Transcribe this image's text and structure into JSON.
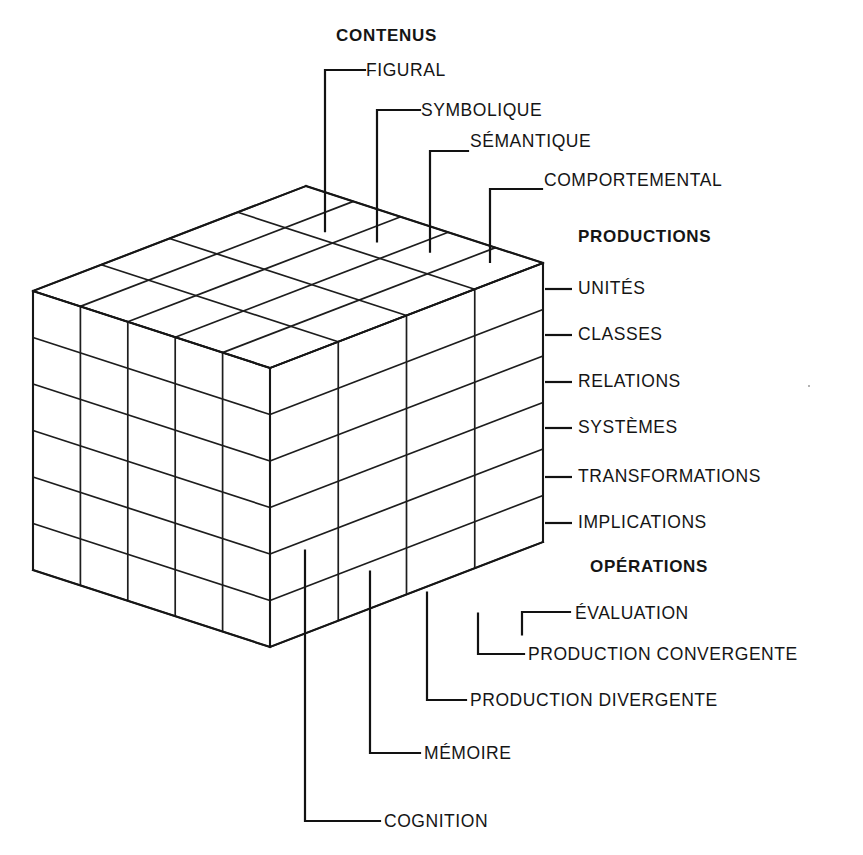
{
  "diagram": {
    "model": "cube 4 x 6 x 5",
    "axes": {
      "contents": {
        "header": "CONTENUS",
        "items": [
          {
            "label": "FIGURAL"
          },
          {
            "label": "SYMBOLIQUE"
          },
          {
            "label": "SÉMANTIQUE"
          },
          {
            "label": "COMPORTEMENTAL"
          }
        ]
      },
      "productions": {
        "header": "PRODUCTIONS",
        "items": [
          {
            "label": "UNITÉS"
          },
          {
            "label": "CLASSES"
          },
          {
            "label": "RELATIONS"
          },
          {
            "label": "SYSTÈMES"
          },
          {
            "label": "TRANSFORMATIONS"
          },
          {
            "label": "IMPLICATIONS"
          }
        ]
      },
      "operations": {
        "header": "OPÉRATIONS",
        "items": [
          {
            "label": "ÉVALUATION"
          },
          {
            "label": "PRODUCTION CONVERGENTE"
          },
          {
            "label": "PRODUCTION DIVERGENTE"
          },
          {
            "label": "MÉMOIRE"
          },
          {
            "label": "COGNITION"
          }
        ]
      }
    },
    "colors": {
      "ink": "#151515",
      "background": "#ffffff"
    }
  },
  "chart_data": {
    "type": "diagram",
    "dimensions": [
      {
        "name": "CONTENUS",
        "count": 4,
        "categories": [
          "FIGURAL",
          "SYMBOLIQUE",
          "SÉMANTIQUE",
          "COMPORTEMENTAL"
        ]
      },
      {
        "name": "PRODUCTIONS",
        "count": 6,
        "categories": [
          "UNITÉS",
          "CLASSES",
          "RELATIONS",
          "SYSTÈMES",
          "TRANSFORMATIONS",
          "IMPLICATIONS"
        ]
      },
      {
        "name": "OPÉRATIONS",
        "count": 5,
        "categories": [
          "ÉVALUATION",
          "PRODUCTION CONVERGENTE",
          "PRODUCTION DIVERGENTE",
          "MÉMOIRE",
          "COGNITION"
        ]
      }
    ],
    "total_cells": 120
  }
}
